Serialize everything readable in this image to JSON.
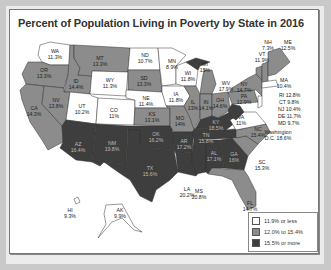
{
  "chart_data": {
    "type": "choropleth",
    "title": "Percent of Population Living in Poverty by State in 2016",
    "legend": [
      {
        "label": "11.9% or less",
        "color": "#ffffff"
      },
      {
        "label": "12.0% to 15.4%",
        "color": "#8c8c8c"
      },
      {
        "label": "15.5% or more",
        "color": "#3e3e3e"
      }
    ],
    "states": [
      {
        "code": "WA",
        "value": "11.3%"
      },
      {
        "code": "OR",
        "value": "13.3%"
      },
      {
        "code": "CA",
        "value": "14.3%"
      },
      {
        "code": "ID",
        "value": "14.4%"
      },
      {
        "code": "NV",
        "value": "13.8%"
      },
      {
        "code": "MT",
        "value": "13.3%"
      },
      {
        "code": "WY",
        "value": "11.3%"
      },
      {
        "code": "UT",
        "value": "10.2%"
      },
      {
        "code": "AZ",
        "value": "16.4%"
      },
      {
        "code": "CO",
        "value": "11%"
      },
      {
        "code": "NM",
        "value": "19.8%"
      },
      {
        "code": "ND",
        "value": "10.7%"
      },
      {
        "code": "SD",
        "value": "13.3%"
      },
      {
        "code": "NE",
        "value": "11.4%"
      },
      {
        "code": "KS",
        "value": "13.1%"
      },
      {
        "code": "OK",
        "value": "16.2%"
      },
      {
        "code": "TX",
        "value": "15.6%"
      },
      {
        "code": "MN",
        "value": "8.9%"
      },
      {
        "code": "IA",
        "value": "11.8%"
      },
      {
        "code": "MO",
        "value": "14%"
      },
      {
        "code": "AR",
        "value": "17.2%"
      },
      {
        "code": "LA",
        "value": "20.2%"
      },
      {
        "code": "WI",
        "value": "11.8%"
      },
      {
        "code": "IL",
        "value": "13%"
      },
      {
        "code": "MI",
        "value": "15%"
      },
      {
        "code": "IN",
        "value": "14.1%"
      },
      {
        "code": "OH",
        "value": "14.6%"
      },
      {
        "code": "KY",
        "value": "18.5%"
      },
      {
        "code": "TN",
        "value": "15.8%"
      },
      {
        "code": "MS",
        "value": "20.8%"
      },
      {
        "code": "AL",
        "value": "17.1%"
      },
      {
        "code": "GA",
        "value": "16%"
      },
      {
        "code": "FL",
        "value": "14.7%"
      },
      {
        "code": "SC",
        "value": "15.3%"
      },
      {
        "code": "NC",
        "value": "15.4%"
      },
      {
        "code": "VA",
        "value": "11%"
      },
      {
        "code": "WV",
        "value": "17.9%"
      },
      {
        "code": "PA",
        "value": "12.9%"
      },
      {
        "code": "NY",
        "value": "14.7%"
      },
      {
        "code": "VT",
        "value": "11.9%"
      },
      {
        "code": "NH",
        "value": "7.3%"
      },
      {
        "code": "ME",
        "value": "12.5%"
      },
      {
        "code": "MA",
        "value": "10.4%"
      },
      {
        "code": "RI",
        "value": "12.8%"
      },
      {
        "code": "CT",
        "value": "9.8%"
      },
      {
        "code": "NJ",
        "value": "10.4%"
      },
      {
        "code": "DE",
        "value": "11.7%"
      },
      {
        "code": "MD",
        "value": "9.7%"
      },
      {
        "code": "Washington D.C.",
        "value": "18.6%"
      },
      {
        "code": "AK",
        "value": "9.9%"
      },
      {
        "code": "HI",
        "value": "9.3%"
      }
    ]
  },
  "labels": {
    "WA": [
      "WA",
      "11.3%"
    ],
    "OR": [
      "OR",
      "13.3%"
    ],
    "CA": [
      "CA",
      "14.3%"
    ],
    "ID": [
      "ID",
      "14.4%"
    ],
    "NV": [
      "NV",
      "13.8%"
    ],
    "MT": [
      "MT",
      "13.3%"
    ],
    "WY": [
      "WY",
      "11.3%"
    ],
    "UT": [
      "UT",
      "10.2%"
    ],
    "AZ": [
      "AZ",
      "16.4%"
    ],
    "CO": [
      "CO",
      "11%"
    ],
    "NM": [
      "NM",
      "19.8%"
    ],
    "ND": [
      "ND",
      "10.7%"
    ],
    "SD": [
      "SD",
      "13.3%"
    ],
    "NE": [
      "NE",
      "11.4%"
    ],
    "KS": [
      "KS",
      "13.1%"
    ],
    "OK": [
      "OK",
      "16.2%"
    ],
    "TX": [
      "TX",
      "15.6%"
    ],
    "MN": [
      "MN",
      "8.9%"
    ],
    "IA": [
      "IA",
      "11.8%"
    ],
    "MO": [
      "MO",
      "14%"
    ],
    "AR": [
      "AR",
      "17.2%"
    ],
    "LA": [
      "LA",
      "20.2%"
    ],
    "WI": [
      "WI",
      "11.8%"
    ],
    "IL": [
      "IL",
      "13%"
    ],
    "MI": [
      "MI",
      "15%"
    ],
    "IN": [
      "IN",
      "14.1%"
    ],
    "OH": [
      "OH",
      "14.6%"
    ],
    "KY": [
      "KY",
      "18.5%"
    ],
    "TN": [
      "TN",
      "15.8%"
    ],
    "MS": [
      "MS",
      "20.8%"
    ],
    "AL": [
      "AL",
      "17.1%"
    ],
    "GA": [
      "GA",
      "16%"
    ],
    "FL": [
      "FL",
      "14.7%"
    ],
    "SC": [
      "SC",
      "15.3%"
    ],
    "NC": [
      "NC",
      "15.4%"
    ],
    "VA": [
      "VA",
      "11%"
    ],
    "WV": [
      "WV",
      "17.9%"
    ],
    "PA": [
      "PA",
      "12.9%"
    ],
    "NY": [
      "NY",
      "14.7%"
    ],
    "VT": [
      "VT",
      "11.9%"
    ],
    "NH": [
      "NH",
      "7.3%"
    ],
    "ME": [
      "ME",
      "12.5%"
    ],
    "MA": [
      "MA",
      "10.4%"
    ],
    "RI": "RI 12.8%",
    "CT": "CT 9.8%",
    "NJ": "NJ 10.4%",
    "DE": "DE 11.7%",
    "MD": "MD 9.7%",
    "DC": [
      "Washington",
      "D.C. 18.6%"
    ],
    "AK": [
      "AK",
      "9.9%"
    ],
    "HI": [
      "HI",
      "9.3%"
    ]
  }
}
